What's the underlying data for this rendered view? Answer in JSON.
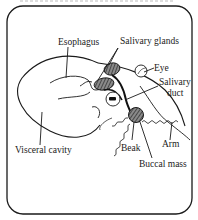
{
  "diagram": {
    "type": "anatomical-diagram",
    "labels": {
      "esophagus": "Esophagus",
      "salivary_glands": "Salivary glands",
      "eye": "Eye",
      "salivary_duct_line1": "Salivary",
      "salivary_duct_line2": "duct",
      "arm": "Arm",
      "beak": "Beak",
      "buccal_mass": "Buccal mass",
      "visceral_cavity": "Visceral cavity"
    },
    "colors": {
      "stroke": "#1a1a1a",
      "background": "#ffffff",
      "gland_fill": "#6e6e6e"
    }
  }
}
